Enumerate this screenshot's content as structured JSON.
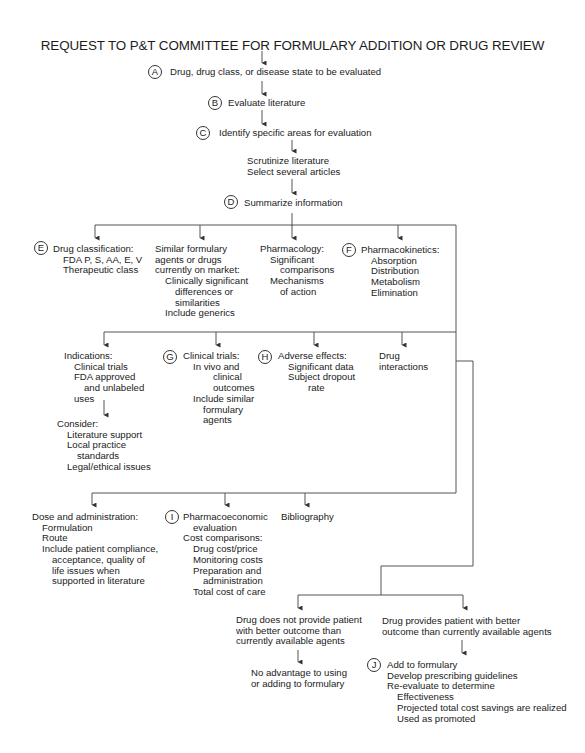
{
  "title": "REQUEST TO P&T COMMITTEE FOR FORMULARY ADDITION OR DRUG REVIEW",
  "steps": {
    "A": {
      "badge": "A",
      "text": "Drug, drug class, or disease state to be evaluated"
    },
    "B": {
      "badge": "B",
      "text": "Evaluate literature"
    },
    "C": {
      "badge": "C",
      "text": "Identify specific areas for evaluation"
    },
    "scrutinize": {
      "lines": [
        "Scrutinize literature",
        "Select several articles"
      ]
    },
    "D": {
      "badge": "D",
      "text": "Summarize information"
    }
  },
  "row1": {
    "drug_classification": {
      "badge": "E",
      "lines": [
        "Drug classification:",
        "FDA P, S, AA, E, V",
        "Therapeutic class"
      ]
    },
    "similar_agents": {
      "lines": [
        "Similar formulary",
        "agents or drugs",
        "currently on market:",
        "Clinically significant",
        "differences or",
        "similarities",
        "Include generics"
      ]
    },
    "pharmacology": {
      "lines": [
        "Pharmacology:",
        "Significant",
        "comparisons",
        "Mechanisms",
        "of action"
      ]
    },
    "pharmacokinetics": {
      "badge": "F",
      "lines": [
        "Pharmacokinetics:",
        "Absorption",
        "Distribution",
        "Metabolism",
        "Elimination"
      ]
    }
  },
  "row2": {
    "indications": {
      "lines": [
        "Indications:",
        "Clinical trials",
        "FDA approved",
        "and unlabeled",
        "uses"
      ]
    },
    "consider": {
      "lines": [
        "Consider:",
        "Literature support",
        "Local practice",
        "standards",
        "Legal/ethical issues"
      ]
    },
    "clinical_trials": {
      "badge": "G",
      "lines": [
        "Clinical trials:",
        "In vivo and",
        "clinical",
        "outcomes",
        "Include similar",
        "formulary",
        "agents"
      ]
    },
    "adverse_effects": {
      "badge": "H",
      "lines": [
        "Adverse effects:",
        "Significant data",
        "Subject dropout",
        "rate"
      ]
    },
    "drug_interactions": {
      "lines": [
        "Drug",
        "interactions"
      ]
    }
  },
  "row3": {
    "dose_admin": {
      "lines": [
        "Dose and administration:",
        "Formulation",
        "Route",
        "Include patient compliance,",
        "acceptance, quality of",
        "life issues when",
        "supported in literature"
      ]
    },
    "pharmacoeconomic": {
      "badge": "I",
      "lines": [
        "Pharmacoeconomic",
        "evaluation",
        "Cost comparisons:",
        "Drug cost/price",
        "Monitoring costs",
        "Preparation and",
        "administration",
        "Total cost of care"
      ]
    },
    "bibliography": {
      "lines": [
        "Bibliography"
      ]
    }
  },
  "outcomes": {
    "no_better": {
      "lines": [
        "Drug does not provide patient",
        "with better outcome than",
        "currently available agents"
      ]
    },
    "no_advantage": {
      "lines": [
        "No advantage to using",
        "or adding to formulary"
      ]
    },
    "better": {
      "lines": [
        "Drug provides patient with better",
        "outcome than currently available agents"
      ]
    },
    "add": {
      "badge": "J",
      "lines": [
        "Add to formulary",
        "Develop prescribing guidelines",
        "Re-evaluate to determine",
        "Effectiveness",
        "Projected total cost savings are realized",
        "Used as promoted"
      ]
    }
  }
}
